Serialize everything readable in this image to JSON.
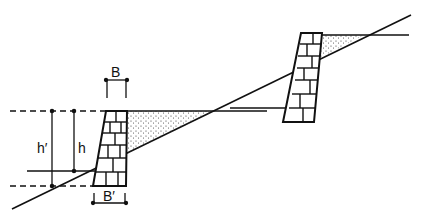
{
  "diagram": {
    "type": "retaining-walls-on-slope",
    "colors": {
      "line": "#111111",
      "background": "#ffffff",
      "fill_dots": "#333333"
    },
    "labels": {
      "top_width": "B",
      "base_width": "B′",
      "height": "h",
      "total_height": "h′"
    },
    "elements": [
      "lower-masonry-wall",
      "upper-masonry-wall",
      "ground-slope-line",
      "backfill-wedge-lower",
      "backfill-wedge-upper"
    ]
  }
}
